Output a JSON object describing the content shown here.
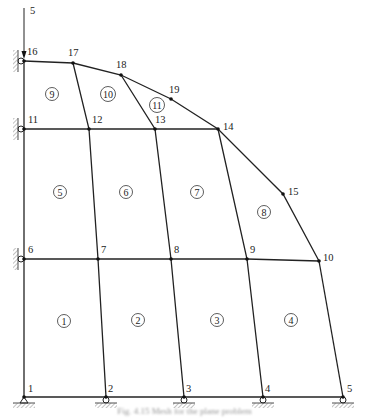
{
  "figure": {
    "type": "finite-element mesh with supports",
    "load": {
      "label": "5",
      "node": 16,
      "direction": "down"
    },
    "nodes": [
      {
        "id": 1,
        "label": "1",
        "x": 24,
        "y": 397
      },
      {
        "id": 2,
        "label": "2",
        "x": 106,
        "y": 397
      },
      {
        "id": 3,
        "label": "3",
        "x": 184,
        "y": 397
      },
      {
        "id": 4,
        "label": "4",
        "x": 263,
        "y": 397
      },
      {
        "id": 5,
        "label": "5",
        "x": 343,
        "y": 397
      },
      {
        "id": 6,
        "label": "6",
        "x": 24,
        "y": 259
      },
      {
        "id": 7,
        "label": "7",
        "x": 98,
        "y": 259
      },
      {
        "id": 8,
        "label": "8",
        "x": 171,
        "y": 259
      },
      {
        "id": 9,
        "label": "9",
        "x": 247,
        "y": 259
      },
      {
        "id": 10,
        "label": "10",
        "x": 319,
        "y": 261
      },
      {
        "id": 11,
        "label": "11",
        "x": 24,
        "y": 129
      },
      {
        "id": 12,
        "label": "12",
        "x": 89,
        "y": 129
      },
      {
        "id": 13,
        "label": "13",
        "x": 155,
        "y": 129
      },
      {
        "id": 14,
        "label": "14",
        "x": 218,
        "y": 129
      },
      {
        "id": 15,
        "label": "15",
        "x": 283,
        "y": 194
      },
      {
        "id": 16,
        "label": "16",
        "x": 24,
        "y": 61
      },
      {
        "id": 17,
        "label": "17",
        "x": 73,
        "y": 63
      },
      {
        "id": 18,
        "label": "18",
        "x": 121,
        "y": 75
      },
      {
        "id": 19,
        "label": "19",
        "x": 171,
        "y": 99
      }
    ],
    "elements": [
      {
        "label": "1",
        "x": 64,
        "y": 321
      },
      {
        "label": "2",
        "x": 138,
        "y": 320
      },
      {
        "label": "3",
        "x": 217,
        "y": 320
      },
      {
        "label": "4",
        "x": 291,
        "y": 320
      },
      {
        "label": "5",
        "x": 60,
        "y": 192
      },
      {
        "label": "6",
        "x": 126,
        "y": 192
      },
      {
        "label": "7",
        "x": 197,
        "y": 192
      },
      {
        "label": "8",
        "x": 264,
        "y": 212
      },
      {
        "label": "9",
        "x": 52,
        "y": 94
      },
      {
        "label": "10",
        "x": 108,
        "y": 94
      },
      {
        "label": "11",
        "x": 157,
        "y": 105
      }
    ],
    "supports": {
      "pin": [
        1
      ],
      "roller_bottom": [
        2,
        3,
        4,
        5
      ],
      "roller_left": [
        6,
        11,
        16
      ]
    },
    "caption": "Fig. 4.15 Mesh for the plane problem"
  }
}
